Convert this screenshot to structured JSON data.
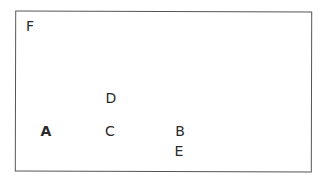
{
  "diagram": {
    "frame": {
      "x": 15,
      "y": 11,
      "width": 297,
      "height": 161
    },
    "labels": [
      {
        "id": "F",
        "text": "F",
        "x": 30,
        "y": 26,
        "bold": false
      },
      {
        "id": "D",
        "text": "D",
        "x": 111,
        "y": 98,
        "bold": false
      },
      {
        "id": "A",
        "text": "A",
        "x": 46,
        "y": 131,
        "bold": true
      },
      {
        "id": "C",
        "text": "C",
        "x": 110,
        "y": 131,
        "bold": false
      },
      {
        "id": "B",
        "text": "B",
        "x": 180,
        "y": 131,
        "bold": false
      },
      {
        "id": "E",
        "text": "E",
        "x": 179,
        "y": 151,
        "bold": false
      }
    ]
  }
}
